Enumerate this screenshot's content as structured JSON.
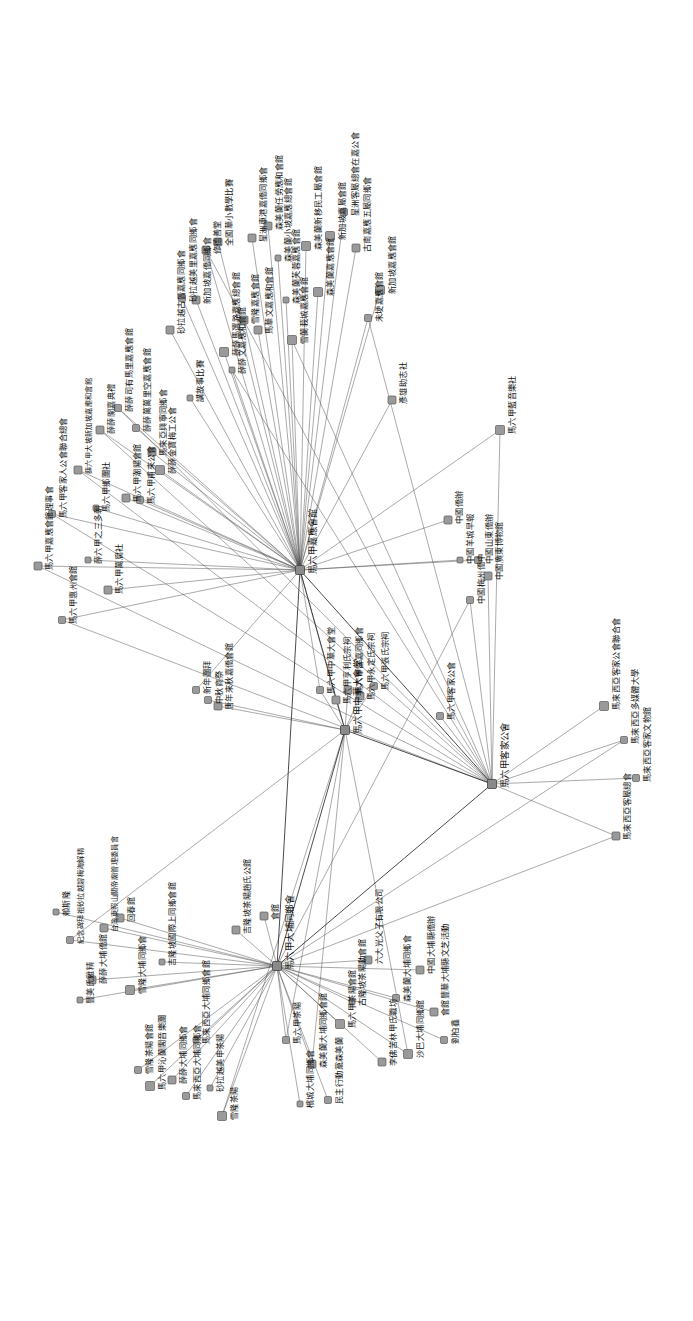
{
  "figure": {
    "type": "network-graph",
    "orientation": "rotated-90-ccw",
    "node_shape": "square",
    "node_color": "#9a9a9a",
    "edge_color": "#4a4a4a",
    "background": "#ffffff"
  },
  "chart_data": {
    "type": "scatter",
    "title": "",
    "xlabel": "",
    "ylabel": "",
    "legend": [],
    "hubs": [
      {
        "id": "h1",
        "label": "馬六甲嘉應會館",
        "x": 300,
        "y": 570,
        "degree": 82
      },
      {
        "id": "h2",
        "label": "馬六甲客家公會",
        "x": 492,
        "y": 784,
        "degree": 38
      },
      {
        "id": "h3",
        "label": "馬六甲大埔同鄉會",
        "x": 277,
        "y": 966,
        "degree": 58
      },
      {
        "id": "h4",
        "label": "馬六甲中華大會堂",
        "x": 345,
        "y": 730,
        "degree": 24
      }
    ],
    "nodes": [
      {
        "label": "馬六甲嘉應會館理事會",
        "x": 38,
        "y": 566
      },
      {
        "label": "馬六甲客家人公會聯合總會",
        "x": 52,
        "y": 514
      },
      {
        "label": "馬六甲惠州會館",
        "x": 62,
        "y": 620
      },
      {
        "label": "薛六甲大坡新加坡嘉應和會館",
        "x": 78,
        "y": 470
      },
      {
        "label": "薛六甲之三多朝",
        "x": 88,
        "y": 560
      },
      {
        "label": "薛薛開嘉典禮",
        "x": 100,
        "y": 430
      },
      {
        "label": "馬六甲鄉團社",
        "x": 96,
        "y": 508
      },
      {
        "label": "馬六甲萬腐社",
        "x": 108,
        "y": 590
      },
      {
        "label": "薛薛司有馬里嘉應會館",
        "x": 118,
        "y": 408
      },
      {
        "label": "馬六甲潮陽會館",
        "x": 126,
        "y": 498
      },
      {
        "label": "薛薛萬萬里空嘉應會館",
        "x": 136,
        "y": 428
      },
      {
        "label": "馬六甲甫來公會",
        "x": 140,
        "y": 500
      },
      {
        "label": "馬來亞興寧同鄉會",
        "x": 152,
        "y": 452
      },
      {
        "label": "薛薛金寶梅工公會",
        "x": 160,
        "y": 470
      },
      {
        "label": "砂拉越古晉嘉應同鄉會",
        "x": 170,
        "y": 330
      },
      {
        "label": "砂拉越美里嘉應同鄉會",
        "x": 182,
        "y": 298
      },
      {
        "label": "講故事比賽",
        "x": 190,
        "y": 398
      },
      {
        "label": "新加坡嘉僑同鄉會",
        "x": 196,
        "y": 300
      },
      {
        "label": "修德善堂",
        "x": 206,
        "y": 250
      },
      {
        "label": "全國華小數學比賽",
        "x": 218,
        "y": 242
      },
      {
        "label": "薛薛馬選路嘉應總會館",
        "x": 224,
        "y": 352
      },
      {
        "label": "薛薛文嘉應和會館",
        "x": 232,
        "y": 370
      },
      {
        "label": "雪隆嘉應會館",
        "x": 244,
        "y": 320
      },
      {
        "label": "星洲車港嘉僑同鄉會",
        "x": 252,
        "y": 238
      },
      {
        "label": "馬華文嘉應和會館",
        "x": 258,
        "y": 330
      },
      {
        "label": "森美蘭任勞應和會館",
        "x": 268,
        "y": 226
      },
      {
        "label": "森美蘭小坡嘉應總會館",
        "x": 278,
        "y": 258
      },
      {
        "label": "森美蘭芙蓉嘉應會館",
        "x": 286,
        "y": 300
      },
      {
        "label": "雪蘭莪城嘉應會館",
        "x": 292,
        "y": 340
      },
      {
        "label": "森美蘭新移民工屬會館",
        "x": 306,
        "y": 246
      },
      {
        "label": "森美蘭嘉應會館",
        "x": 318,
        "y": 292
      },
      {
        "label": "新加坡嘉屬會館",
        "x": 330,
        "y": 236
      },
      {
        "label": "星洲客屬總會在嘉公會",
        "x": 344,
        "y": 212
      },
      {
        "label": "古南嘉應五屬同鄉會",
        "x": 356,
        "y": 248
      },
      {
        "label": "未埂嘉應會館",
        "x": 368,
        "y": 318
      },
      {
        "label": "新加坡嘉應會館",
        "x": 380,
        "y": 290
      },
      {
        "label": "彥雄助志社",
        "x": 392,
        "y": 400
      },
      {
        "label": "中國僑辦",
        "x": 448,
        "y": 520
      },
      {
        "label": "中國羊城早報",
        "x": 460,
        "y": 560
      },
      {
        "label": "中國梅州僑中",
        "x": 470,
        "y": 600
      },
      {
        "label": "中國山東僑辦",
        "x": 478,
        "y": 560
      },
      {
        "label": "中國廣東博物館",
        "x": 488,
        "y": 576
      },
      {
        "label": "馬六甲藍音樂社",
        "x": 500,
        "y": 430
      },
      {
        "label": "新年團拜",
        "x": 196,
        "y": 690
      },
      {
        "label": "中秋商祭",
        "x": 208,
        "y": 700
      },
      {
        "label": "唐年來秋嘉僑會館",
        "x": 218,
        "y": 706
      },
      {
        "label": "馬六甲中華大會堂",
        "x": 320,
        "y": 690
      },
      {
        "label": "馬六甲亨利氏宗祠",
        "x": 336,
        "y": 700
      },
      {
        "label": "馬六甲雷嘉同鄉會",
        "x": 348,
        "y": 690
      },
      {
        "label": "馬六甲永定氏宗祠",
        "x": 360,
        "y": 696
      },
      {
        "label": "馬六甲張氏宗祠",
        "x": 374,
        "y": 686
      },
      {
        "label": "馬六甲客家公會",
        "x": 440,
        "y": 716
      },
      {
        "label": "馬來西亞客家公會聯合會",
        "x": 604,
        "y": 706
      },
      {
        "label": "馬來西亞多媒體大學",
        "x": 624,
        "y": 740
      },
      {
        "label": "馬來西亞客家文物館",
        "x": 636,
        "y": 778
      },
      {
        "label": "馬來西亞客屬總會",
        "x": 616,
        "y": 836
      },
      {
        "label": "賴斯隆",
        "x": 56,
        "y": 912
      },
      {
        "label": "紀念碑拜祖砂拉越碧梅海解精",
        "x": 70,
        "y": 940
      },
      {
        "label": "豐美氏雞精",
        "x": 80,
        "y": 1000
      },
      {
        "label": "薛薛大埔僑館",
        "x": 92,
        "y": 980
      },
      {
        "label": "台灣東照山關帝廟管理委員會",
        "x": 104,
        "y": 928
      },
      {
        "label": "回春館",
        "x": 120,
        "y": 918
      },
      {
        "label": "雪隆大埔同鄉會",
        "x": 130,
        "y": 990
      },
      {
        "label": "雪隆茶陽會館",
        "x": 138,
        "y": 1070
      },
      {
        "label": "馬六甲沁蘭閣音樂團",
        "x": 150,
        "y": 1086
      },
      {
        "label": "吉隆坡國際上同鄉會館",
        "x": 162,
        "y": 962
      },
      {
        "label": "薛薛大埔同鄉會",
        "x": 172,
        "y": 1080
      },
      {
        "label": "馬來西亞大埔同鄉會",
        "x": 186,
        "y": 1096
      },
      {
        "label": "馬來西亞大埔同鄉會館",
        "x": 196,
        "y": 1040
      },
      {
        "label": "砂拉越美申茶陽",
        "x": 210,
        "y": 1088
      },
      {
        "label": "雪隆茶陽",
        "x": 222,
        "y": 1116
      },
      {
        "label": "吉隆坡茶陽趙氏公館",
        "x": 236,
        "y": 930
      },
      {
        "label": "會館",
        "x": 264,
        "y": 916
      },
      {
        "label": "馬六甲茶陽",
        "x": 286,
        "y": 1040
      },
      {
        "label": "檳城大埔同鄉會",
        "x": 300,
        "y": 1104
      },
      {
        "label": "森美蘭大埔同鄉會館",
        "x": 312,
        "y": 1064
      },
      {
        "label": "民主行動黨森美蘭",
        "x": 328,
        "y": 1100
      },
      {
        "label": "馬六甲茶陽會館",
        "x": 340,
        "y": 1024
      },
      {
        "label": "古隆坡茶陽動會館",
        "x": 352,
        "y": 1002
      },
      {
        "label": "六大光父子有限公司",
        "x": 368,
        "y": 960
      },
      {
        "label": "李佛苦林甲氏職坊",
        "x": 382,
        "y": 1062
      },
      {
        "label": "森美蘭大埔同鄉會",
        "x": 396,
        "y": 998
      },
      {
        "label": "沙巴大埔同鄉館",
        "x": 408,
        "y": 1054
      },
      {
        "label": "中國大埔縣僑辦",
        "x": 420,
        "y": 970
      },
      {
        "label": "會館豐華大埔縣文芝活動",
        "x": 434,
        "y": 1012
      },
      {
        "label": "劉柏鑫",
        "x": 444,
        "y": 1040
      }
    ],
    "edge_count": 202,
    "node_count": 120,
    "layout": "radial-hub-spoke"
  }
}
